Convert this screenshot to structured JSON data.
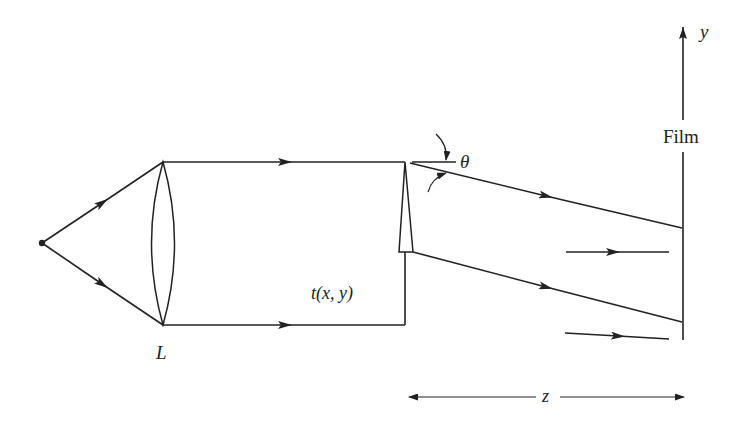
{
  "diagram": {
    "type": "optics-ray-diagram",
    "labels": {
      "lens": "L",
      "transmittance": "t(x, y)",
      "angle": "θ",
      "film": "Film",
      "y_axis": "y",
      "distance": "z"
    },
    "elements": [
      {
        "id": "point-source",
        "desc": "Point source emitting diverging rays"
      },
      {
        "id": "lens",
        "label": "L",
        "desc": "Collimating lens"
      },
      {
        "id": "prism",
        "label": "t(x, y)",
        "desc": "Thin prism with transmittance t(x,y) deflecting beam by angle θ"
      },
      {
        "id": "film",
        "label": "Film",
        "desc": "Recording film plane along y axis"
      },
      {
        "id": "reference-beam",
        "desc": "Undeflected parallel reference rays reaching film"
      }
    ],
    "dimension": {
      "label": "z",
      "desc": "Distance from prism to film"
    },
    "colors": {
      "line": "#222222",
      "background": "#ffffff"
    }
  }
}
